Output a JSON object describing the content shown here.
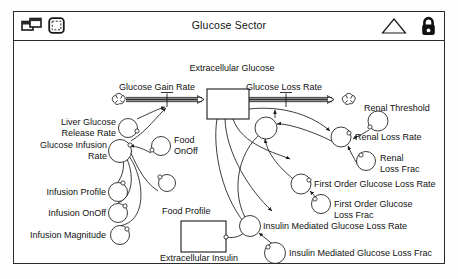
{
  "window": {
    "title": "Glucose Sector",
    "icons": {
      "view_toggle": "windows-stack-icon",
      "sector_frame": "rounded-square-icon",
      "up_triangle": "triangle-up-icon",
      "lock": "padlock-icon"
    }
  },
  "diagram": {
    "type": "stock-and-flow",
    "stocks": [
      {
        "id": "extracellular_glucose",
        "label": "Extracellular Glucose",
        "x": 205,
        "y": 78,
        "w": 42,
        "h": 30,
        "label_pos": "above"
      },
      {
        "id": "extracellular_insulin",
        "label": "Extracellular Insulin",
        "x": 181,
        "y": 211,
        "w": 44,
        "h": 31,
        "label_pos": "below"
      }
    ],
    "flows": [
      {
        "id": "glucose_gain_rate",
        "label": "Glucose Gain Rate",
        "from": "cloud_left",
        "to": "extracellular_glucose"
      },
      {
        "id": "glucose_loss_rate",
        "label": "Glucose Loss Rate",
        "from": "extracellular_glucose",
        "to": "cloud_right"
      }
    ],
    "clouds": [
      {
        "id": "cloud_left",
        "x": 108,
        "y": 89
      },
      {
        "id": "cloud_right",
        "x": 338,
        "y": 89
      }
    ],
    "variables": [
      {
        "id": "liver_glucose_release_rate",
        "label": "Liver Glucose\nRelease Rate",
        "line1": "Liver Glucose",
        "line2": "Release Rate",
        "cx": 105,
        "cy": 108,
        "r": 9
      },
      {
        "id": "glucose_infusion_rate",
        "label": "Glucose Infusion\nRate",
        "line1": "Glucose Infusion",
        "line2": "Rate",
        "cx": 106,
        "cy": 137,
        "r": 11
      },
      {
        "id": "infusion_profile",
        "label": "Infusion Profile",
        "cx": 104,
        "cy": 161,
        "r": 9
      },
      {
        "id": "infusion_onoff",
        "label": "Infusion OnOff",
        "cx": 104,
        "cy": 182,
        "r": 9
      },
      {
        "id": "infusion_magnitude",
        "label": "Infusion Magnitude",
        "cx": 106,
        "cy": 205,
        "r": 9
      },
      {
        "id": "food_onoff",
        "label": "Food OnOff",
        "line1": "Food",
        "line2": "OnOff",
        "cx": 148,
        "cy": 138,
        "r": 9
      },
      {
        "id": "food_magnitude_unlabeled",
        "label": "",
        "cx": 153,
        "cy": 174,
        "r": 8
      },
      {
        "id": "food_profile",
        "label": "Food Profile",
        "cx": 0,
        "cy": 0,
        "r": 0
      },
      {
        "id": "renal_threshold",
        "label": "Renal Threshold",
        "cx": 376,
        "cy": 102,
        "r": 10
      },
      {
        "id": "renal_loss_rate",
        "label": "Renal Loss Rate",
        "cx": 349,
        "cy": 124,
        "r": 10
      },
      {
        "id": "renal_loss_frac",
        "label": "Renal\nLoss Frac",
        "line1": "Renal",
        "line2": "Loss Frac",
        "cx": 363,
        "cy": 149,
        "r": 9
      },
      {
        "id": "first_order_glucose_loss_rate",
        "label": "First Order Glucose Loss Rate",
        "cx": 311,
        "cy": 173,
        "r": 10
      },
      {
        "id": "first_order_glucose_loss_frac",
        "label": "First Order Glucose\nLoss Frac",
        "line1": "First Order Glucose",
        "line2": "Loss Frac",
        "cx": 330,
        "cy": 198,
        "r": 9
      },
      {
        "id": "insulin_mediated_glucose_loss_rate",
        "label": "Insulin Mediated Glucose Loss Rate",
        "cx": 249,
        "cy": 218,
        "r": 10
      },
      {
        "id": "insulin_mediated_glucose_loss_frac",
        "label": "Insulin Mediated Glucose Loss Frac",
        "cx": 281,
        "cy": 244,
        "r": 10
      },
      {
        "id": "glucose_loss_rate_valve_var",
        "label": "",
        "cx": 271,
        "cy": 110,
        "r": 11
      }
    ],
    "labels": {
      "extracellular_glucose": "Extracellular Glucose",
      "glucose_gain_rate": "Glucose Gain Rate",
      "glucose_loss_rate": "Glucose Loss Rate",
      "renal_threshold": "Renal Threshold",
      "renal_loss_rate": "Renal Loss Rate",
      "renal_loss_frac_l1": "Renal",
      "renal_loss_frac_l2": "Loss Frac",
      "liver_glucose_release_rate_l1": "Liver Glucose",
      "liver_glucose_release_rate_l2": "Release Rate",
      "glucose_infusion_rate_l1": "Glucose Infusion",
      "glucose_infusion_rate_l2": "Rate",
      "infusion_profile": "Infusion Profile",
      "infusion_onoff": "Infusion OnOff",
      "infusion_magnitude": "Infusion Magnitude",
      "food_onoff_l1": "Food",
      "food_onoff_l2": "OnOff",
      "food_profile": "Food Profile",
      "extracellular_insulin": "Extracellular Insulin",
      "first_order_glucose_loss_rate": "First Order Glucose Loss Rate",
      "first_order_glucose_loss_frac_l1": "First Order Glucose",
      "first_order_glucose_loss_frac_l2": "Loss Frac",
      "insulin_mediated_glucose_loss_rate": "Insulin Mediated Glucose Loss Rate",
      "insulin_mediated_glucose_loss_frac": "Insulin Mediated Glucose Loss Frac"
    },
    "colors": {
      "stroke": "#1a1a1a",
      "flow_fill": "#8c8c8c",
      "background": "#ffffff"
    }
  }
}
